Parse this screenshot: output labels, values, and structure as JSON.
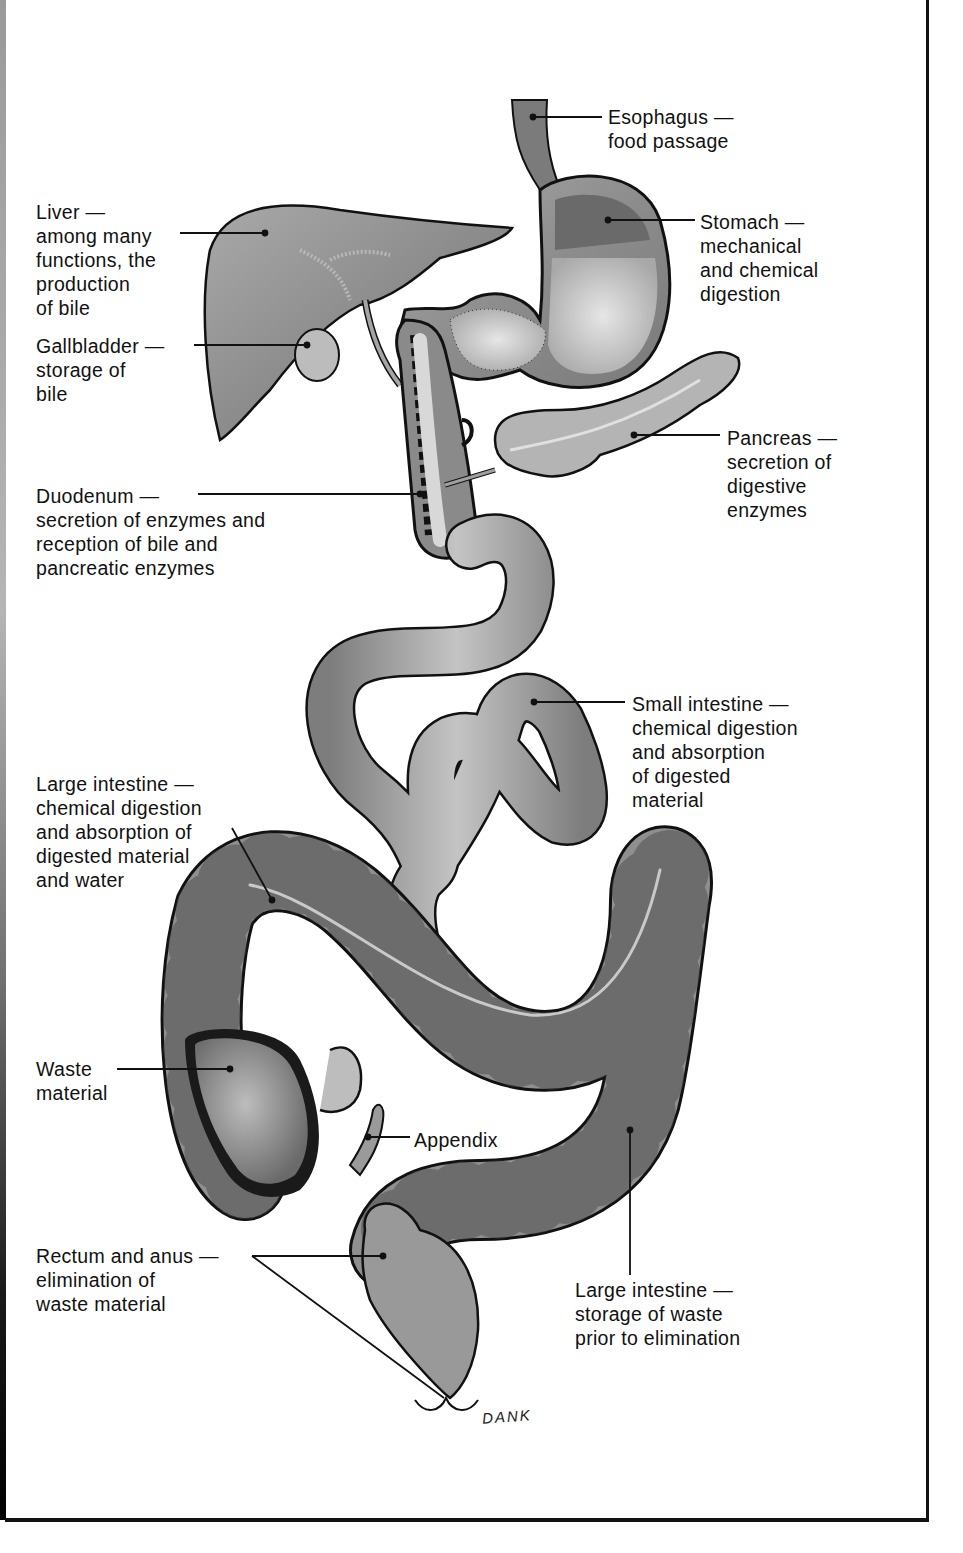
{
  "figure": {
    "artist_signature": "DANK",
    "colors": {
      "organ_fill": "#8f8f8f",
      "organ_light": "#c8c8c8",
      "outline": "#111111",
      "background": "#ffffff"
    }
  },
  "labels": [
    {
      "id": "esophagus",
      "lines": [
        "Esophagus —",
        "food passage"
      ]
    },
    {
      "id": "stomach",
      "lines": [
        "Stomach —",
        "mechanical",
        "and chemical",
        "digestion"
      ]
    },
    {
      "id": "liver",
      "lines": [
        "Liver —",
        "among many",
        "functions, the",
        "production",
        "of bile"
      ]
    },
    {
      "id": "gallbladder",
      "lines": [
        "Gallbladder —",
        "storage of",
        "bile"
      ]
    },
    {
      "id": "pancreas",
      "lines": [
        "Pancreas —",
        "secretion of",
        "digestive",
        "enzymes"
      ]
    },
    {
      "id": "duodenum",
      "lines": [
        "Duodenum —",
        "secretion of enzymes and",
        "reception of bile and",
        "pancreatic enzymes"
      ]
    },
    {
      "id": "small_intestine",
      "lines": [
        "Small intestine —",
        "chemical digestion",
        "and absorption",
        "of digested",
        "material"
      ]
    },
    {
      "id": "large_intestine_absorption",
      "lines": [
        "Large intestine —",
        "chemical digestion",
        "and absorption of",
        "digested material",
        "and water"
      ]
    },
    {
      "id": "waste",
      "lines": [
        "Waste",
        "material"
      ]
    },
    {
      "id": "appendix",
      "lines": [
        "Appendix"
      ]
    },
    {
      "id": "rectum_anus",
      "lines": [
        "Rectum and anus —",
        "elimination of",
        "waste material"
      ]
    },
    {
      "id": "large_intestine_storage",
      "lines": [
        "Large intestine —",
        "storage of waste",
        "prior to elimination"
      ]
    }
  ],
  "text": {
    "esophagus": "Esophagus —\nfood passage",
    "stomach": "Stomach —\nmechanical\nand chemical\ndigestion",
    "liver": "Liver —\namong many\nfunctions, the\nproduction\nof bile",
    "gallbladder": "Gallbladder —\nstorage of\nbile",
    "pancreas": "Pancreas —\nsecretion of\ndigestive\nenzymes",
    "duodenum": "Duodenum —\nsecretion of enzymes and\nreception of bile and\npancreatic enzymes",
    "small_intestine": "Small intestine —\nchemical digestion\nand absorption\nof digested\nmaterial",
    "large_intestine_absorption": "Large intestine —\nchemical digestion\nand absorption of\ndigested material\nand water",
    "waste": "Waste\nmaterial",
    "appendix": "Appendix",
    "rectum_anus": "Rectum and anus —\nelimination of\nwaste material",
    "large_intestine_storage": "Large intestine —\nstorage of waste\nprior to elimination",
    "signature": "DANK"
  }
}
